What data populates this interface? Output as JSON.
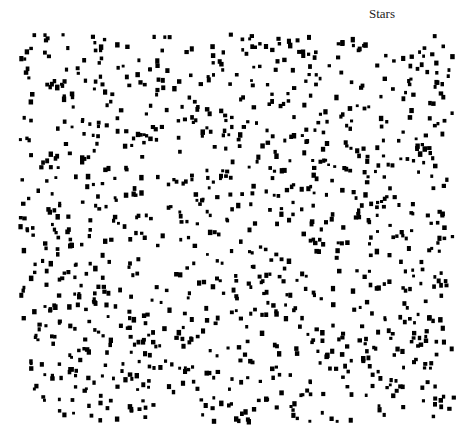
{
  "label": "Stars",
  "field": {
    "dot_color": "#000000",
    "background": "#ffffff",
    "dot_count": 1100,
    "x_range": [
      18,
      452
    ],
    "y_range": [
      32,
      420
    ],
    "dot_size_px": 3.5
  }
}
